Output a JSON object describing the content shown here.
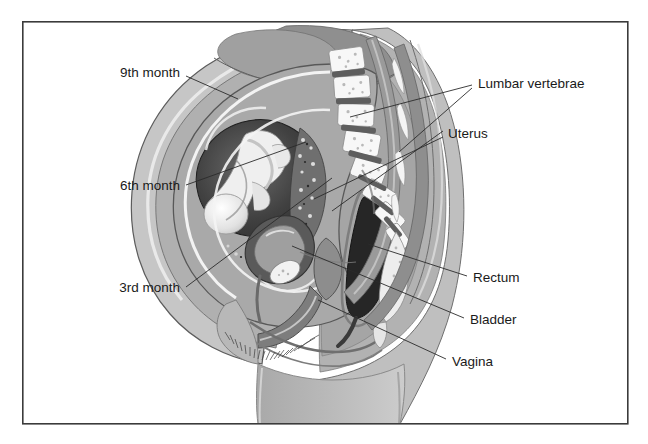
{
  "figure": {
    "background_color": "#ffffff",
    "frame_color": "#3b3b3b",
    "label_color": "#1a1a1a",
    "leader_color": "#2b2b2b",
    "frame": {
      "x": 22,
      "y": 21,
      "width": 606,
      "height": 403
    }
  },
  "labels": {
    "ninth_month": "9th month",
    "sixth_month": "6th month",
    "third_month": "3rd month",
    "lumbar_vertebrae": "Lumbar vertebrae",
    "uterus": "Uterus",
    "rectum": "Rectum",
    "bladder": "Bladder",
    "vagina": "Vagina"
  },
  "callouts": [
    {
      "name": "9th month",
      "side": "left",
      "text_x": 180,
      "text_y": 73,
      "anchor": "end"
    },
    {
      "name": "6th month",
      "side": "left",
      "text_x": 180,
      "text_y": 186,
      "anchor": "end"
    },
    {
      "name": "3rd month",
      "side": "left",
      "text_x": 180,
      "text_y": 288,
      "anchor": "end"
    },
    {
      "name": "Lumbar vertebrae",
      "side": "right",
      "text_x": 478,
      "text_y": 84,
      "anchor": "start"
    },
    {
      "name": "Uterus",
      "side": "right",
      "text_x": 448,
      "text_y": 134,
      "anchor": "start"
    },
    {
      "name": "Rectum",
      "side": "right",
      "text_x": 473,
      "text_y": 278,
      "anchor": "start"
    },
    {
      "name": "Bladder",
      "side": "right",
      "text_x": 470,
      "text_y": 320,
      "anchor": "start"
    },
    {
      "name": "Vagina",
      "side": "right",
      "text_x": 452,
      "text_y": 362,
      "anchor": "start"
    }
  ],
  "palette": {
    "skin_outer": "#c9c9c9",
    "skin_mid": "#b4b4b4",
    "muscle": "#9d9d9d",
    "deep_tissue": "#8a8a8a",
    "uterus_wall": "#a8a8a8",
    "amniotic_dark": "#3c3c3c",
    "amniotic_mid": "#5a5a5a",
    "fetus_light": "#f0f0f0",
    "fetus_shade": "#cfcfcf",
    "bone_white": "#f6f6f6",
    "disc_dark": "#5e5e5e",
    "rectum_dark": "#2a2a2a",
    "bladder_light": "#d8d8d8",
    "outline": "#4a4a4a",
    "highlight": "#ffffff"
  }
}
